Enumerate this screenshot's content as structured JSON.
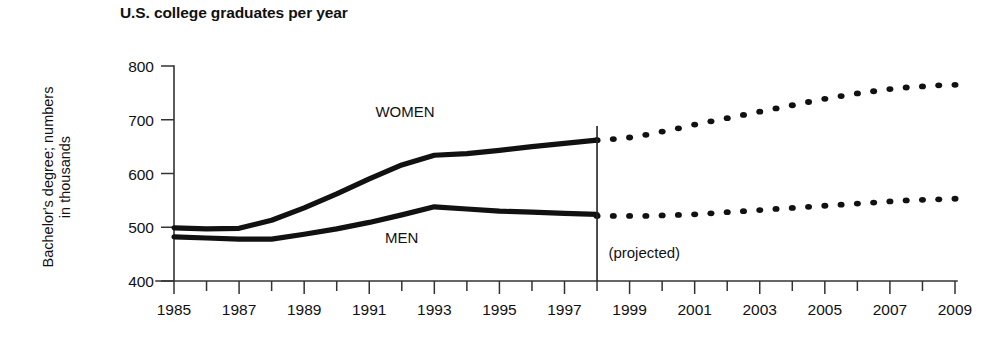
{
  "chart_data": {
    "type": "line",
    "title": "U.S. college graduates per year",
    "xlabel": "",
    "ylabel": "Bachelor's degree; numbers\nin thousands",
    "ylim": [
      400,
      800
    ],
    "yticks": [
      400,
      500,
      600,
      700,
      800
    ],
    "xlim": [
      1985,
      2009
    ],
    "xticks": [
      1985,
      1987,
      1989,
      1991,
      1993,
      1995,
      1997,
      1999,
      2001,
      2003,
      2005,
      2007,
      2009
    ],
    "xtick_labels": [
      "1985",
      "1987",
      "1989",
      "1991",
      "1993",
      "1995",
      "1997",
      "1999",
      "2001",
      "2003",
      "2005",
      "2007",
      "2009"
    ],
    "minor_xticks_every": 1,
    "grid": false,
    "legend": "inline-annotations",
    "annotations": [
      {
        "text": "WOMEN",
        "x": 1992.1,
        "y": 705,
        "name": "women-series-label"
      },
      {
        "text": "MEN",
        "x": 1992.0,
        "y": 470,
        "name": "men-series-label"
      },
      {
        "text": "(projected)",
        "x": 1998.35,
        "y": 443,
        "name": "projected-note"
      }
    ],
    "divider_year": 1998,
    "series": [
      {
        "name": "WOMEN",
        "style": "solid",
        "x": [
          1985,
          1986,
          1987,
          1988,
          1989,
          1990,
          1991,
          1992,
          1993,
          1994,
          1995,
          1996,
          1997,
          1998
        ],
        "values": [
          499,
          497,
          498,
          513,
          536,
          562,
          590,
          616,
          634,
          637,
          643,
          650,
          656,
          662
        ]
      },
      {
        "name": "WOMEN (projected)",
        "style": "dotted",
        "x": [
          1998,
          1998.5,
          1999,
          1999.5,
          2000,
          2000.5,
          2001,
          2001.5,
          2002,
          2002.5,
          2003,
          2003.5,
          2004,
          2004.5,
          2005,
          2005.5,
          2006,
          2006.5,
          2007,
          2007.5,
          2008,
          2008.5,
          2009
        ],
        "values": [
          662,
          664,
          667,
          672,
          678,
          684,
          691,
          697,
          703,
          709,
          715,
          721,
          727,
          733,
          739,
          744,
          749,
          753,
          757,
          760,
          762,
          764,
          765
        ]
      },
      {
        "name": "MEN",
        "style": "solid",
        "x": [
          1985,
          1986,
          1987,
          1988,
          1989,
          1990,
          1991,
          1992,
          1993,
          1994,
          1995,
          1996,
          1997,
          1998
        ],
        "values": [
          482,
          480,
          478,
          478,
          487,
          497,
          509,
          523,
          538,
          534,
          530,
          528,
          526,
          524
        ]
      },
      {
        "name": "MEN (projected)",
        "style": "dotted",
        "x": [
          1998,
          1998.5,
          1999,
          1999.5,
          2000,
          2000.5,
          2001,
          2001.5,
          2002,
          2002.5,
          2003,
          2003.5,
          2004,
          2004.5,
          2005,
          2005.5,
          2006,
          2006.5,
          2007,
          2007.5,
          2008,
          2008.5,
          2009
        ],
        "values": [
          521,
          521,
          521,
          521,
          522,
          523,
          524,
          526,
          528,
          530,
          532,
          534,
          536,
          538,
          540,
          542,
          544,
          546,
          548,
          550,
          551,
          552,
          553
        ]
      }
    ]
  },
  "colors": {
    "ink": "#111111",
    "axis": "#333333",
    "background": "#ffffff"
  }
}
